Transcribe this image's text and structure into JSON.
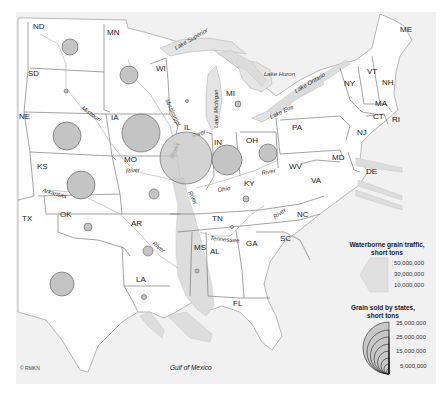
{
  "map": {
    "title": "Waterborne grain traffic and grain sold by states",
    "colors": {
      "background": "#ffffff",
      "land_outside": "#f0f0f0",
      "land_states": "#ffffff",
      "water": "#e6e6e6",
      "flow": "#dcdcdc",
      "circle_fill": "#c4c4c4",
      "circle_stroke": "#555555",
      "border": "#666666"
    },
    "states": [
      {
        "code": "ND",
        "x": 33,
        "y": 29
      },
      {
        "code": "MN",
        "x": 107,
        "y": 35
      },
      {
        "code": "SD",
        "x": 28,
        "y": 76
      },
      {
        "code": "WI",
        "x": 156,
        "y": 71
      },
      {
        "code": "MI",
        "x": 226,
        "y": 96
      },
      {
        "code": "NE",
        "x": 19,
        "y": 119
      },
      {
        "code": "IA",
        "x": 111,
        "y": 120
      },
      {
        "code": "IL",
        "x": 184,
        "y": 130
      },
      {
        "code": "IN",
        "x": 214,
        "y": 145
      },
      {
        "code": "OH",
        "x": 246,
        "y": 143
      },
      {
        "code": "PA",
        "x": 292,
        "y": 130
      },
      {
        "code": "NY",
        "x": 344,
        "y": 86
      },
      {
        "code": "VT",
        "x": 367,
        "y": 74
      },
      {
        "code": "NH",
        "x": 382,
        "y": 85
      },
      {
        "code": "ME",
        "x": 400,
        "y": 32
      },
      {
        "code": "MA",
        "x": 375,
        "y": 106
      },
      {
        "code": "CT",
        "x": 373,
        "y": 119
      },
      {
        "code": "RI",
        "x": 392,
        "y": 122
      },
      {
        "code": "NJ",
        "x": 357,
        "y": 135
      },
      {
        "code": "MO",
        "x": 124,
        "y": 162
      },
      {
        "code": "KS",
        "x": 37,
        "y": 169
      },
      {
        "code": "KY",
        "x": 244,
        "y": 186
      },
      {
        "code": "WV",
        "x": 289,
        "y": 169
      },
      {
        "code": "MD",
        "x": 332,
        "y": 160
      },
      {
        "code": "DE",
        "x": 366,
        "y": 174
      },
      {
        "code": "VA",
        "x": 311,
        "y": 183
      },
      {
        "code": "TX",
        "x": 22,
        "y": 221
      },
      {
        "code": "OK",
        "x": 60,
        "y": 217
      },
      {
        "code": "AR",
        "x": 131,
        "y": 226
      },
      {
        "code": "TN",
        "x": 212,
        "y": 221
      },
      {
        "code": "NC",
        "x": 297,
        "y": 217
      },
      {
        "code": "MS",
        "x": 194,
        "y": 250
      },
      {
        "code": "AL",
        "x": 210,
        "y": 254
      },
      {
        "code": "GA",
        "x": 246,
        "y": 246
      },
      {
        "code": "SC",
        "x": 280,
        "y": 241
      },
      {
        "code": "LA",
        "x": 136,
        "y": 282
      },
      {
        "code": "FL",
        "x": 233,
        "y": 306
      }
    ],
    "water_labels": [
      {
        "text": "Lake Superior",
        "x": 176,
        "y": 50,
        "rot": -30
      },
      {
        "text": "Lake Michigan",
        "x": 218,
        "y": 128,
        "rot": -90
      },
      {
        "text": "Lake Huron",
        "x": 264,
        "y": 76,
        "rot": 0
      },
      {
        "text": "Lake Huron2",
        "x": 0,
        "y": 0,
        "rot": 0
      },
      {
        "text": "Lake Erie",
        "x": 271,
        "y": 119,
        "rot": -25
      },
      {
        "text": "Lake Ontario",
        "x": 296,
        "y": 93,
        "rot": -30
      },
      {
        "text": "Missouri",
        "x": 81,
        "y": 109,
        "rot": 35
      },
      {
        "text": "Mississippi",
        "x": 165,
        "y": 100,
        "rot": 65
      },
      {
        "text": "Illinois",
        "x": 173,
        "y": 159,
        "rot": -65
      },
      {
        "text": "River",
        "x": 193,
        "y": 138,
        "rot": -20
      },
      {
        "text": "River",
        "x": 126,
        "y": 173,
        "rot": -5
      },
      {
        "text": "Arkansas",
        "x": 42,
        "y": 192,
        "rot": 15
      },
      {
        "text": "River",
        "x": 188,
        "y": 192,
        "rot": 65
      },
      {
        "text": "Ohio",
        "x": 218,
        "y": 192,
        "rot": -10
      },
      {
        "text": "River",
        "x": 262,
        "y": 175,
        "rot": -10
      },
      {
        "text": "River",
        "x": 275,
        "y": 219,
        "rot": -35
      },
      {
        "text": "River",
        "x": 152,
        "y": 244,
        "rot": 40
      },
      {
        "text": "Tennessee",
        "x": 210,
        "y": 240,
        "rot": 5
      }
    ],
    "circles": [
      {
        "state": "ND",
        "cx": 70,
        "cy": 47,
        "r": 8
      },
      {
        "state": "MN",
        "cx": 129,
        "cy": 75,
        "r": 9
      },
      {
        "state": "SD",
        "cx": 66,
        "cy": 91,
        "r": 2
      },
      {
        "state": "WI",
        "cx": 187,
        "cy": 101,
        "r": 1.5
      },
      {
        "state": "MI",
        "cx": 238,
        "cy": 104,
        "r": 3
      },
      {
        "state": "NE",
        "cx": 67,
        "cy": 136,
        "r": 14
      },
      {
        "state": "IA",
        "cx": 141,
        "cy": 133,
        "r": 19
      },
      {
        "state": "IL",
        "cx": 186,
        "cy": 158,
        "r": 26
      },
      {
        "state": "IN",
        "cx": 227,
        "cy": 160,
        "r": 15
      },
      {
        "state": "OH",
        "cx": 268,
        "cy": 153,
        "r": 9
      },
      {
        "state": "KS",
        "cx": 81,
        "cy": 185,
        "r": 14
      },
      {
        "state": "MO",
        "cx": 154,
        "cy": 194,
        "r": 5
      },
      {
        "state": "KY",
        "cx": 246,
        "cy": 199,
        "r": 3
      },
      {
        "state": "TN",
        "cx": 232,
        "cy": 227,
        "r": 1.5
      },
      {
        "state": "OK",
        "cx": 88,
        "cy": 227,
        "r": 4
      },
      {
        "state": "AR",
        "cx": 148,
        "cy": 251,
        "r": 5
      },
      {
        "state": "MS",
        "cx": 197,
        "cy": 271,
        "r": 2
      },
      {
        "state": "LA",
        "cx": 144,
        "cy": 297,
        "r": 2.5
      },
      {
        "state": "TX",
        "cx": 62,
        "cy": 284,
        "r": 12
      }
    ],
    "gulf_label": "Gulf of Mexico",
    "copyright": "© RMKN"
  },
  "legend": {
    "traffic": {
      "title_line1": "Waterborne grain traffic,",
      "title_line2": "short tons",
      "values": [
        "50,000,000",
        "30,000,000",
        "10,000,000"
      ]
    },
    "sold": {
      "title_line1": "Grain sold by states,",
      "title_line2": "short tons",
      "values": [
        "35,000,000",
        "25,000,000",
        "15,000,000",
        "5,000,000"
      ]
    }
  }
}
